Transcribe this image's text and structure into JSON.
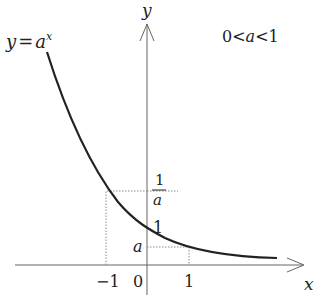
{
  "diagram": {
    "title_formula": {
      "lhs": "y",
      "eq": "=",
      "base": "a",
      "exp": "x"
    },
    "condition": {
      "left": "0",
      "op1": "<",
      "var": "a",
      "op2": "<",
      "right": "1"
    },
    "axes": {
      "x_label": "x",
      "y_label": "y",
      "origin_label": "0"
    },
    "ticks": {
      "x_neg_one": "−1",
      "x_one": "1",
      "y_one": "1",
      "y_a": "a",
      "y_inv_a_num": "1",
      "y_inv_a_den": "a"
    },
    "colors": {
      "curve": "#222222",
      "axis": "#555555",
      "guide": "#777777"
    }
  }
}
